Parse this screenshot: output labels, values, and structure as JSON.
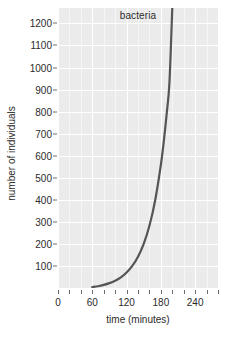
{
  "chart_data": {
    "type": "line",
    "title": "bacteria",
    "xlabel": "time (minutes)",
    "ylabel": "number of individuals",
    "xlim": [
      0,
      280
    ],
    "ylim": [
      0,
      1270
    ],
    "grid": true,
    "legend": "none",
    "x_major_ticks": [
      0,
      60,
      120,
      180,
      240
    ],
    "x_major_tick_labels": [
      "0",
      "60",
      "120",
      "180",
      "240"
    ],
    "x_minor_ticks": [
      20,
      40,
      80,
      100,
      140,
      160,
      200,
      220,
      260,
      280
    ],
    "y_major_ticks": [
      100,
      200,
      300,
      400,
      500,
      600,
      700,
      800,
      900,
      1000,
      1100,
      1200
    ],
    "y_major_tick_labels": [
      "100",
      "200",
      "300",
      "400",
      "500",
      "600",
      "700",
      "800",
      "900",
      "1000",
      "1100",
      "1200"
    ],
    "series": [
      {
        "name": "bacteria",
        "color": "#555555",
        "x": [
          60,
          70,
          80,
          90,
          100,
          110,
          120,
          130,
          140,
          150,
          160,
          170,
          180,
          185,
          190,
          195,
          200
        ],
        "y": [
          4,
          8,
          14,
          22,
          33,
          48,
          70,
          100,
          142,
          200,
          282,
          397,
          558,
          662,
          785,
          931,
          1270
        ]
      }
    ]
  },
  "colors": {
    "panel_background": "#ebebeb",
    "gridline": "#ffffff",
    "curve": "#555555",
    "text": "#2b2b2b",
    "tick": "#6e6e6e",
    "page_background": "#ffffff"
  }
}
